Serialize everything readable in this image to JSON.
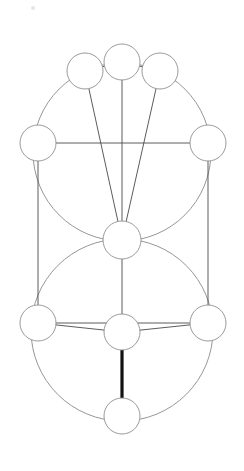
{
  "document": {
    "title": "Tree of Life Diagram",
    "background_color": "#ffffff",
    "width": 244,
    "height": 471
  },
  "style": {
    "node_fill": "#ffffff",
    "node_stroke": "#8f8f8f",
    "node_stroke_width": 0.9,
    "edge_stroke": "#4a4a4a",
    "edge_stroke_width": 0.9,
    "highlight_edge_stroke": "#111111",
    "highlight_edge_stroke_width": 3.2,
    "arc_stroke": "#8a8a8a",
    "arc_stroke_width": 0.9
  },
  "chart_data": {
    "type": "diagram",
    "nodes": [
      {
        "id": "top-left",
        "label": "",
        "cx": 85,
        "cy": 71,
        "r": 18
      },
      {
        "id": "top-center",
        "label": "",
        "cx": 122,
        "cy": 62,
        "r": 18
      },
      {
        "id": "top-right",
        "label": "",
        "cx": 160,
        "cy": 71,
        "r": 18
      },
      {
        "id": "mid-left",
        "label": "",
        "cx": 38,
        "cy": 143,
        "r": 18
      },
      {
        "id": "mid-right",
        "label": "",
        "cx": 208,
        "cy": 143,
        "r": 18
      },
      {
        "id": "center",
        "label": "",
        "cx": 122,
        "cy": 240,
        "r": 19
      },
      {
        "id": "low-left",
        "label": "",
        "cx": 38,
        "cy": 323,
        "r": 18
      },
      {
        "id": "low-center",
        "label": "",
        "cx": 122,
        "cy": 332,
        "r": 18
      },
      {
        "id": "low-right",
        "label": "",
        "cx": 208,
        "cy": 323,
        "r": 18
      },
      {
        "id": "bottom",
        "label": "",
        "cx": 122,
        "cy": 416,
        "r": 18
      }
    ],
    "edges": [
      {
        "from": "top-left",
        "to": "top-center",
        "highlight": false
      },
      {
        "from": "top-center",
        "to": "top-right",
        "highlight": false
      },
      {
        "from": "top-left",
        "to": "center",
        "highlight": false
      },
      {
        "from": "top-center",
        "to": "center",
        "highlight": false
      },
      {
        "from": "top-right",
        "to": "center",
        "highlight": false
      },
      {
        "from": "mid-left",
        "to": "mid-right",
        "highlight": false
      },
      {
        "from": "mid-left",
        "to": "low-left",
        "highlight": false
      },
      {
        "from": "mid-right",
        "to": "low-right",
        "highlight": false
      },
      {
        "from": "center",
        "to": "low-center",
        "highlight": false
      },
      {
        "from": "low-left",
        "to": "low-right",
        "highlight": false
      },
      {
        "from": "low-left",
        "to": "low-center",
        "highlight": false
      },
      {
        "from": "low-center",
        "to": "low-right",
        "highlight": false
      },
      {
        "from": "low-center",
        "to": "bottom",
        "highlight": true
      }
    ],
    "circles": [
      {
        "id": "upper-great-circle",
        "cx": 122,
        "cy": 152,
        "r": 89
      },
      {
        "id": "lower-great-circle",
        "cx": 122,
        "cy": 330,
        "r": 91
      }
    ],
    "speck": {
      "cx": 33,
      "cy": 8,
      "r": 2
    }
  }
}
